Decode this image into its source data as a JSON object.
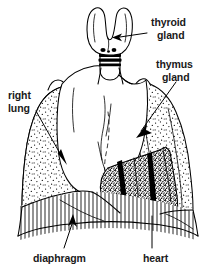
{
  "figure": {
    "background_color": "#ffffff",
    "ink_color": "#000000",
    "text_color": "#1a1a1a"
  },
  "labels": {
    "thyroid": {
      "line1": "thyroid",
      "line2": "gland"
    },
    "thymus": {
      "line1": "thymus",
      "line2": "gland"
    },
    "right_lung": {
      "line1": "right",
      "line2": "lung"
    },
    "diaphragm": {
      "line1": "diaphragm"
    },
    "heart": {
      "line1": "heart"
    }
  },
  "structures": [
    {
      "name": "thyroid-gland",
      "fill": "white",
      "outline": "black"
    },
    {
      "name": "trachea",
      "fill": "white",
      "outline": "black"
    },
    {
      "name": "thymus-gland",
      "fill": "white",
      "outline": "black"
    },
    {
      "name": "right-lung",
      "fill": "stippled",
      "outline": "black"
    },
    {
      "name": "left-lung",
      "fill": "stippled",
      "outline": "black"
    },
    {
      "name": "heart",
      "fill": "dense-stipple",
      "outline": "black"
    },
    {
      "name": "diaphragm",
      "fill": "hatched",
      "outline": "black"
    }
  ]
}
